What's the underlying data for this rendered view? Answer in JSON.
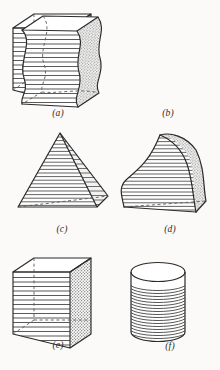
{
  "plate": {
    "background_color": "#fbfaf8",
    "ink_color": "#2b2b2b",
    "hatch_color": "#4a4a4a",
    "shade_color": "#8a8a8a"
  },
  "figures": [
    {
      "id": "a",
      "caption": "(a)",
      "shape_name": "rectangular-prism",
      "description": "Cube shown in oblique projection with horizontal hatching on the front face, stippled shading on the right face, and dashed hidden edges.",
      "hatch_lines": 17,
      "has_hidden_edges": true
    },
    {
      "id": "b",
      "caption": "(b)",
      "shape_name": "wavy-prism",
      "description": "Prism with S-curved left and right profiles, horizontally hatched front face and stippled curved right face.",
      "hatch_lines": 17,
      "has_hidden_edges": true
    },
    {
      "id": "c",
      "caption": "(c)",
      "shape_name": "pyramid",
      "description": "Square pyramid in oblique projection with horizontal hatching on both visible faces and a dashed base edge.",
      "hatch_lines": 20,
      "has_hidden_edges": true
    },
    {
      "id": "d",
      "caption": "(d)",
      "shape_name": "curved-horn-solid",
      "description": "Horn-shaped solid with a curved apex, horizontally hatched body and stippled narrow right face.",
      "hatch_lines": 20,
      "has_hidden_edges": true
    },
    {
      "id": "e",
      "caption": "(e)",
      "shape_name": "rectangular-prism",
      "description": "Second cube identical to (a): horizontal hatching on the front face, stippled right face, dashed hidden edges.",
      "hatch_lines": 17,
      "has_hidden_edges": true
    },
    {
      "id": "f",
      "caption": "(f)",
      "shape_name": "cylinder",
      "description": "Right circular cylinder with an elliptical top and arced horizontal hatching around the lateral surface.",
      "hatch_lines": 22,
      "has_hidden_edges": false
    }
  ]
}
